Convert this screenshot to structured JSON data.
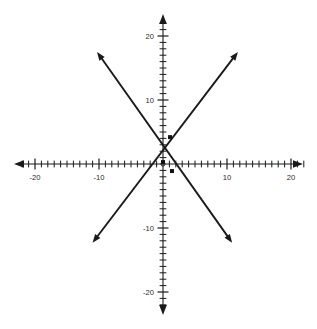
{
  "figure": {
    "title": "",
    "background_color": "#ffffff",
    "ink_color": "#1a1a1a",
    "width": 317,
    "height": 329
  },
  "axes": {
    "origin_px": {
      "x": 163,
      "y": 164
    },
    "pixels_per_unit": 6.4,
    "x_label": "",
    "y_label": "",
    "x_tick_labels": [
      "-20",
      "-10",
      "10",
      "20"
    ],
    "y_tick_labels": [
      "20",
      "10",
      "-10",
      "-20"
    ],
    "x_tick_values": [
      -20,
      -10,
      10,
      20
    ],
    "y_tick_values": [
      20,
      10,
      -10,
      -20
    ],
    "minor_tick_step": 1,
    "major_tick_step": 10,
    "xlim": [
      -23,
      23
    ],
    "ylim": [
      -22,
      22
    ],
    "grid": false,
    "arrowheads_on_axes": true
  },
  "chart_data": {
    "type": "line",
    "title": "",
    "xlabel": "",
    "ylabel": "",
    "xlim": [
      -23,
      23
    ],
    "ylim": [
      -22,
      22
    ],
    "grid": false,
    "legend": "none",
    "x_ticks": [
      -20,
      -10,
      0,
      10,
      20
    ],
    "y_ticks": [
      -20,
      -10,
      0,
      10,
      20
    ],
    "x_tick_labels": [
      "-20",
      "-10",
      "",
      "10",
      "20"
    ],
    "y_tick_labels": [
      "-20",
      "-10",
      "",
      "10",
      "20"
    ],
    "series": [
      {
        "name": "rising-line",
        "type": "line",
        "slope": 1.31,
        "intercept": 0,
        "style": "solid",
        "color": "#1a1a1a",
        "arrow_both_ends": true,
        "endpoints": [
          {
            "x": -11.0,
            "y": -12.3
          },
          {
            "x": 11.7,
            "y": 17.5
          }
        ]
      },
      {
        "name": "falling-line",
        "type": "line",
        "slope": -1.41,
        "intercept": 0,
        "style": "solid",
        "color": "#1a1a1a",
        "arrow_both_ends": true,
        "endpoints": [
          {
            "x": -10.3,
            "y": 17.5
          },
          {
            "x": 10.8,
            "y": -12.3
          }
        ]
      }
    ],
    "points": [
      {
        "name": "point-upper",
        "x": 1.1,
        "y": 4.2,
        "marker": "square",
        "color": "#111111"
      },
      {
        "name": "point-origin",
        "x": 0.0,
        "y": 0.3,
        "marker": "square",
        "color": "#111111"
      },
      {
        "name": "point-lower",
        "x": 1.4,
        "y": -1.1,
        "marker": "square",
        "color": "#111111"
      }
    ],
    "intersection": {
      "x": 0,
      "y": 0
    }
  }
}
